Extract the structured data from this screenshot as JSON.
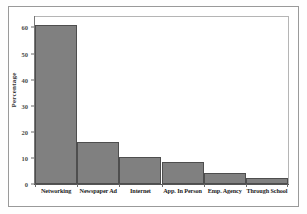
{
  "chart_data": {
    "type": "bar",
    "title": "",
    "xlabel": "",
    "ylabel": "Percentage",
    "categories": [
      "Networking",
      "Newspaper Ad",
      "Internet",
      "App. In Person",
      "Emp. Agency",
      "Through School"
    ],
    "values": [
      61,
      16.2,
      10.3,
      8.5,
      4.2,
      2.2
    ],
    "ylim": [
      0,
      64
    ],
    "yticks": [
      0,
      10,
      20,
      30,
      40,
      50,
      60
    ],
    "ytick_labels": [
      "0",
      "10",
      "20",
      "30",
      "40",
      "50",
      "60"
    ],
    "grid": false,
    "legend": null,
    "bar_fill_color": "#808080",
    "bar_edge_color": "#4e4e4e",
    "plot_background": "#ffffff",
    "frame_color": "#9a9a9a"
  }
}
